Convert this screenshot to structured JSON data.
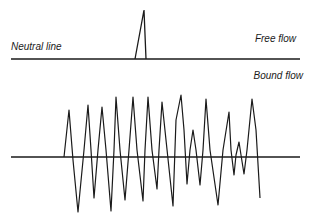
{
  "diagram": {
    "labels": {
      "neutral_line": "Neutral line",
      "free_flow": "Free flow",
      "bound_flow": "Bound flow"
    },
    "colors": {
      "stroke": "#1a1a1a",
      "background": "#ffffff"
    },
    "free_flow": {
      "baseline": {
        "x1": 11,
        "x2": 300,
        "y": 59
      },
      "spike_points": "135,59 144,10 146,59"
    },
    "bound_flow": {
      "baseline": {
        "x1": 11,
        "x2": 300,
        "y": 157
      },
      "wave_points": "64,157 69,110 73,160 78,212 84,150 88,105 91,150 94,198 98,150 102,107 106,150 111,211 114,150 116,97 120,150 125,200 129,150 133,97 137,150 143,201 145,150 148,97 152,150 157,189 159,150 162,102 166,140 173,206 176,120 181,95 184,130 187,184 190,150 193,130 196,150 200,185 203,150 206,99 210,150 218,205 223,150 229,112 231,150 234,175 236,155 239,142 241,155 244,174 247,150 252,99 256,130 260,198"
    }
  }
}
